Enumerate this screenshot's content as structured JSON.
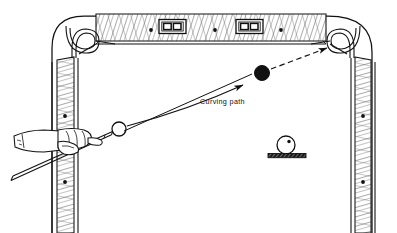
{
  "figure": {
    "type": "technical-line-illustration",
    "background_color": "#ffffff",
    "ink_color": "#111111"
  },
  "annotations": {
    "curving_path_label": "Curving path"
  },
  "table": {
    "name": "billiard-table",
    "frame_color": "#111111",
    "rail_fill": "#ffffff",
    "cushion_texture": "wood-grain-hatching",
    "top_rail": {
      "name": "top-rail",
      "x": 96,
      "y": 14,
      "width": 232,
      "height": 27,
      "diamond_dots": [
        {
          "cx": 151,
          "cy": 30
        },
        {
          "cx": 215,
          "cy": 30
        },
        {
          "cx": 281,
          "cy": 30
        }
      ],
      "plaques": [
        {
          "name": "rail-plaque-left",
          "x": 159,
          "y": 20,
          "width": 27,
          "height": 13
        },
        {
          "name": "rail-plaque-right",
          "x": 236,
          "y": 20,
          "width": 27,
          "height": 13
        }
      ]
    },
    "left_rail": {
      "name": "left-rail",
      "x": 52,
      "y": 55,
      "width": 22,
      "height": 178,
      "diamond_dots": [
        {
          "cx": 63,
          "cy": 116
        },
        {
          "cx": 63,
          "cy": 182
        }
      ]
    },
    "right_rail": {
      "name": "right-rail",
      "x": 352,
      "y": 55,
      "width": 22,
      "height": 178,
      "diamond_dots": [
        {
          "cx": 363,
          "cy": 116
        },
        {
          "cx": 363,
          "cy": 182
        }
      ]
    },
    "pockets": [
      {
        "name": "corner-pocket-top-left",
        "cx": 79,
        "cy": 39,
        "r": 13
      },
      {
        "name": "corner-pocket-top-right",
        "cx": 345,
        "cy": 39,
        "r": 13
      }
    ]
  },
  "balls": {
    "cue_ball": {
      "name": "cue-ball",
      "cx": 119,
      "cy": 129,
      "r": 7,
      "fill": "#ffffff",
      "stroke": "#111111"
    },
    "object_ball": {
      "name": "object-ball",
      "cx": 262,
      "cy": 73,
      "r": 7.5,
      "fill": "#111111",
      "stroke": "#111111"
    }
  },
  "paths": {
    "curving_path": {
      "name": "curving-path-arrow",
      "style": "solid-with-arrowhead",
      "from": {
        "x": 128,
        "cy": 127
      },
      "to": {
        "x": 243,
        "y": 83
      }
    },
    "object_ball_path": {
      "name": "object-ball-path-arrow",
      "style": "dashed-with-arrowhead",
      "from": {
        "x": 271,
        "y": 69
      },
      "to": {
        "x": 330,
        "y": 48
      }
    },
    "cue_stick": {
      "name": "cue-stick",
      "style": "double-line",
      "tip": {
        "x": 112,
        "y": 132
      },
      "butt": {
        "x": 14,
        "y": 176
      }
    }
  },
  "hand": {
    "name": "bridge-hand",
    "description": "hand forming a bridge over the left rail",
    "x": 14,
    "y": 128,
    "width": 78,
    "height": 38
  },
  "inset": {
    "name": "tip-contact-inset",
    "description": "cue ball resting on a hatched base with contact dot",
    "ball": {
      "cx": 286,
      "cy": 145,
      "r": 9,
      "fill": "#ffffff",
      "stroke": "#111111"
    },
    "contact_dot": {
      "cx": 289,
      "cy": 142,
      "r": 1.6,
      "fill": "#111111"
    },
    "base_bar": {
      "x": 268,
      "y": 154,
      "width": 38,
      "height": 4,
      "fill": "#111111"
    }
  }
}
